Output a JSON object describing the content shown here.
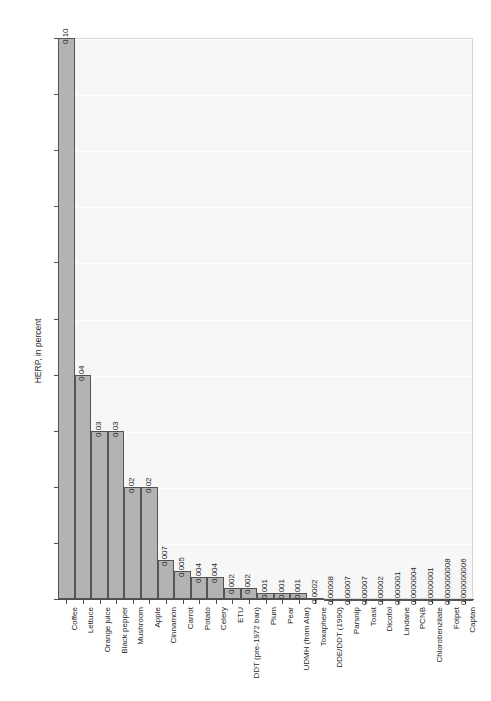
{
  "chart_data": {
    "type": "bar",
    "title": "",
    "xlabel": "",
    "ylabel": "HERP, in percent",
    "ylim": [
      0.0,
      0.1
    ],
    "grid": true,
    "legend": "none",
    "y_ticks": [
      "0.00",
      "0.01",
      "0.02",
      "0.03",
      "0.04",
      "0.05",
      "0.06",
      "0.07",
      "0.08",
      "0.09",
      "0.10"
    ],
    "y_tick_values": [
      0.0,
      0.01,
      0.02,
      0.03,
      0.04,
      0.05,
      0.06,
      0.07,
      0.08,
      0.09,
      0.1
    ],
    "categories": [
      "Coffee",
      "Lettuce",
      "Orange juice",
      "Black pepper",
      "Mushroom",
      "Apple",
      "Cinnamon",
      "Carrot",
      "Potato",
      "Celery",
      "ETU",
      "DDT (pre-1972 ban)",
      "Plum",
      "Pear",
      "UDMH (from Alar)",
      "Toxaphene",
      "DDE/DDT (1990)",
      "Parsnip",
      "Toast",
      "Dicofol",
      "Lindane",
      "PCNB",
      "Chlorobenzilate",
      "Folpet",
      "Captan"
    ],
    "values": [
      0.1,
      0.04,
      0.03,
      0.03,
      0.02,
      0.02,
      0.007,
      0.005,
      0.004,
      0.004,
      0.002,
      0.002,
      0.001,
      0.001,
      0.001,
      0.0002,
      8e-05,
      7e-05,
      7e-05,
      2e-05,
      1e-06,
      4e-07,
      1e-07,
      8e-09,
      6e-09
    ],
    "value_labels": [
      "0.10",
      "0.04",
      "0.03",
      "0.03",
      "0.02",
      "0.02",
      "0.007",
      "0.005",
      "0.004",
      "0.004",
      "0.002",
      "0.002",
      "0.001",
      "0.001",
      "0.001",
      "0.0002",
      "0.00008",
      "0.00007",
      "0.00007",
      "0.00002",
      "0.000001",
      "0.0000004",
      "0.0000001",
      "0.000000008",
      "0.000000006"
    ],
    "colors": {
      "bar_fill": "#b3b3b3",
      "bar_border": "#555555",
      "panel_background": "#f7f7f7",
      "gridline": "#ffffff",
      "axis": "#4d4d4d",
      "text": "#1f1f1f"
    }
  }
}
